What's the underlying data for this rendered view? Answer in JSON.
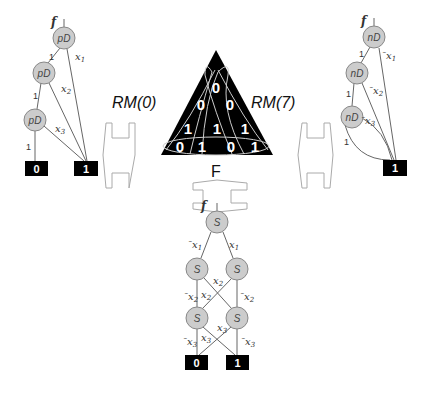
{
  "left_diagram": {
    "function_label": "f",
    "node_label": "pD",
    "nodes": [
      "pD",
      "pD",
      "pD"
    ],
    "edge_labels_left": [
      "1",
      "1",
      "1"
    ],
    "edge_labels_right": [
      "x1",
      "x2",
      "x3"
    ],
    "terminals": [
      "0",
      "1"
    ]
  },
  "right_diagram": {
    "function_label": "f",
    "node_label": "nD",
    "nodes": [
      "nD",
      "nD",
      "nD"
    ],
    "edge_labels_left": [
      "1",
      "1",
      "1"
    ],
    "edge_labels_right": [
      "¯x1",
      "¯x2",
      "¯x3"
    ],
    "terminals": [
      "1"
    ]
  },
  "center": {
    "left_label": "RM(0)",
    "right_label": "RM(7)",
    "bottom_label": "F",
    "triangle_values": {
      "row1": [
        "0"
      ],
      "row2": [
        "0",
        "0"
      ],
      "row3": [
        "1",
        "1",
        "1"
      ],
      "row4": [
        "0",
        "1",
        "0",
        "1"
      ]
    },
    "colors": {
      "triangle_fill": "#000000",
      "triangle_curves": "#cccccc",
      "triangle_text": "#ffffff"
    }
  },
  "bottom_diagram": {
    "function_label": "f",
    "node_label": "S",
    "nodes": [
      "S",
      "S",
      "S",
      "S",
      "S"
    ],
    "edge_labels": {
      "level1": [
        "¯x1",
        "x1"
      ],
      "level2": [
        "¯x2",
        "x2",
        "x2",
        "¯x2"
      ],
      "level3": [
        "¯x3",
        "x3",
        "x3",
        "¯x3"
      ]
    },
    "terminals": [
      "0",
      "1"
    ]
  },
  "arrows": [
    "double-arrow-left",
    "double-arrow-right",
    "double-arrow-bottom"
  ]
}
